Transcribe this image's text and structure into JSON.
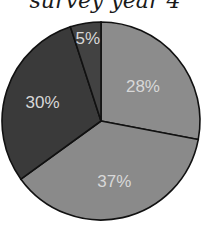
{
  "chart_data": {
    "type": "pie",
    "title": "survey year 4",
    "categories": [
      "Slice A",
      "Slice B",
      "Slice C",
      "Slice D"
    ],
    "values": [
      28,
      37,
      30,
      5
    ],
    "labels": [
      "28%",
      "37%",
      "30%",
      "5%"
    ],
    "colors": [
      "#8c8c8c",
      "#8a8a8a",
      "#3a3a3a",
      "#424242"
    ],
    "start_angle_deg": 0,
    "direction": "clockwise",
    "legend": "none"
  }
}
